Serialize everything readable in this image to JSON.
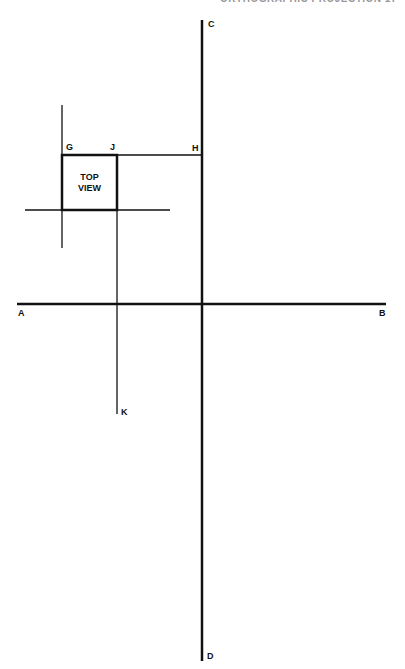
{
  "header": {
    "text": "ORTHOGRAPHIC PROJECTION   17"
  },
  "diagram": {
    "box": {
      "line1": "TOP",
      "line2": "VIEW"
    },
    "labels": {
      "A": "A",
      "B": "B",
      "C": "C",
      "D": "D",
      "G": "G",
      "H": "H",
      "J": "J",
      "K": "K"
    },
    "line_color": "#111111"
  }
}
